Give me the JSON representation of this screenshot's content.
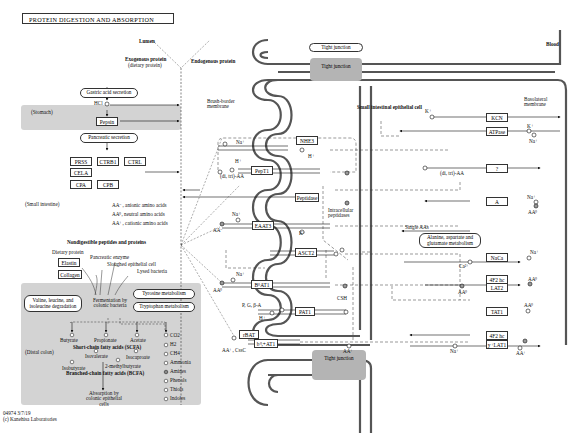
{
  "title": "PROTEIN DIGESTION AND ABSORPTION",
  "compartments": {
    "lumen": "Lumen",
    "blood": "Blood",
    "cell": "Small intestinal epithelial cell",
    "brush_border": "Brush-border membrane",
    "basolateral": "Basolateral membrane",
    "stomach": "(Stomach)",
    "small_intestine": "(Small intestine)",
    "distal_colon": "(Distal colon)",
    "tight_junction_top_label": "Tight junction",
    "tight_junction_top_box": "Tight junction",
    "tight_junction_bottom": "Tight junction"
  },
  "proteins": {
    "exogenous": "Exogenous protein",
    "exogenous_sub": "(dietary protein)",
    "endogenous": "Endogenous protein"
  },
  "stomach": {
    "gastric_secretion": "Gastric acid secretion",
    "hcl": "HCl",
    "pepsin": "Pepsin"
  },
  "pancreas": {
    "secretion": "Pancreatic secretion",
    "enzymes": [
      "PRSS",
      "CTRB1",
      "CTRL",
      "CELA",
      "CPA",
      "CPB"
    ]
  },
  "aa_legend": [
    {
      "sym": "AA⁻",
      "desc": ", anionic amino acids"
    },
    {
      "sym": "AA⁰",
      "desc": ", neutral amino acids"
    },
    {
      "sym": "AA⁺",
      "desc": ", cationic amino acids"
    }
  ],
  "nondigestible": {
    "header": "Nondigestible peptides and proteins",
    "dietary_protein": "Dietary protein",
    "elastin": "Elastin",
    "collagen": "Collagen",
    "pancreatic_enzyme": "Pancreatic enzyme",
    "sloughed_cell": "Sloughed epithelial cell",
    "lysed_bacteria": "Lysed bacteria"
  },
  "colon": {
    "bcaa_degradation": "Valine, leucine, and isoleucine degradation",
    "fermentation": "Fermentation by colonic bacteria",
    "tyrosine": "Tyrosine metabolism",
    "tryptophan": "Tryptophan metabolism",
    "scfa": [
      "Butyrate",
      "Propionate",
      "Acetate"
    ],
    "scfa_label": "Short-chain fatty acids (SCFA)",
    "bcfa": [
      "Isovalerate",
      "Isocaproate",
      "Isobutyrate",
      "2-methylbutyrate"
    ],
    "bcfa_label": "Branched-chain fatty acids (BCFA)",
    "products": [
      "CO2",
      "H2",
      "CH4",
      "Ammonia",
      "Amines",
      "Phenols",
      "Thiols",
      "Indoles"
    ],
    "absorption": "Absorption by colonic epithelial cells"
  },
  "transporters": {
    "apical": [
      "NHE3",
      "PepT1",
      "Peptidase",
      "EAAT3",
      "ASCT2",
      "B⁰AT1",
      "PAT1",
      "rBAT",
      "b⁰,+AT1"
    ],
    "basolateral": [
      "KCN",
      "ATPase",
      "?",
      "A",
      "NaCa",
      "4F2 hc",
      "LAT2",
      "TAT1",
      "4F2 hc",
      "y⁺LAT1"
    ]
  },
  "labels": {
    "na": "Na⁺",
    "h": "H⁺",
    "k": "K⁺",
    "ca": "Ca²⁺",
    "di_tri_aa": "(di, tri)-AA",
    "intracellular_peptidases": "Intracellular peptidases",
    "single_aas": "Single AAs",
    "metabolism": "Metabolism",
    "ala_asp_glu": "Alanine, aspartate and glutamate metabolism",
    "aa_minus": "AA⁻",
    "aa_zero": "AA⁰",
    "aa_plus": "AA⁺",
    "pgba": "P, G, β-A",
    "csh": "CSH",
    "aa_cssc": "AA⁺, CssC"
  },
  "footer": {
    "id": "04974 3/7/19",
    "copyright": "(c) Kanehisa Laboratories"
  }
}
